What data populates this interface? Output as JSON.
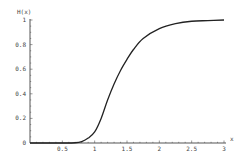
{
  "chart_data": {
    "type": "line",
    "title": "",
    "xlabel": "x",
    "ylabel": "H(x)",
    "xlim": [
      0,
      3
    ],
    "ylim": [
      0,
      1
    ],
    "grid": false,
    "x_ticks": [
      "0.5",
      "1",
      "1.5",
      "2",
      "2.5",
      "3"
    ],
    "y_ticks": [
      "0",
      "0.2",
      "0.4",
      "0.6",
      "0.8",
      "1"
    ],
    "series": [
      {
        "name": "H(x)",
        "x": [
          0,
          0.5,
          0.7,
          0.8,
          0.9,
          1.0,
          1.1,
          1.2,
          1.3,
          1.4,
          1.5,
          1.6,
          1.75,
          2.0,
          2.25,
          2.5,
          2.75,
          3.0
        ],
        "y": [
          0,
          0,
          0.002,
          0.012,
          0.04,
          0.09,
          0.2,
          0.35,
          0.48,
          0.59,
          0.68,
          0.76,
          0.85,
          0.93,
          0.97,
          0.99,
          0.995,
          1.0
        ]
      }
    ]
  }
}
